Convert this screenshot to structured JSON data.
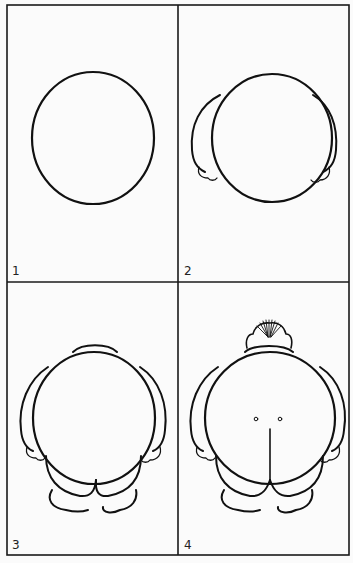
{
  "figure": {
    "colors": {
      "ink": "#111111",
      "paper": "#fbfbfb"
    },
    "panels": [
      {
        "label": "1",
        "step": "Draw a circle"
      },
      {
        "label": "2",
        "step": "Add arms and hands on each side"
      },
      {
        "label": "3",
        "step": "Add collar, legs and feet"
      },
      {
        "label": "4",
        "step": "Add hair tuft, dimples and center seam"
      }
    ]
  }
}
